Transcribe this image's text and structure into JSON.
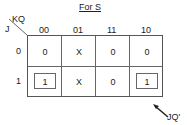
{
  "title": "For S",
  "row_var": "J",
  "col_var": "KQ",
  "col_headers": [
    "00",
    "01",
    "11",
    "10"
  ],
  "row_headers": [
    "0",
    "1"
  ],
  "cells": [
    [
      "0",
      "X",
      "0",
      "0"
    ],
    [
      "1",
      "X",
      "0",
      "1"
    ]
  ],
  "annotation": "JQ'"
}
